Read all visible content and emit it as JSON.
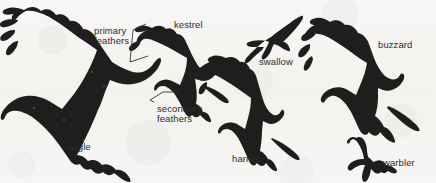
{
  "figure": {
    "background_color": "#f6f5f3",
    "silhouette_color": "#1f1d1b",
    "label_color": "#2b2b2b",
    "leader_line_color": "#3a3a3a",
    "width": 436,
    "height": 183
  },
  "labels": {
    "primary_feathers": "primary\nfeathers",
    "secondary_feathers": "secondary\nfeathers",
    "kestrel": "kestrel",
    "swallow": "swallow",
    "buzzard": "buzzard",
    "eagle": "eagle",
    "harrier": "harrier",
    "warbler": "warbler"
  },
  "birds": [
    {
      "name": "eagle",
      "label": "eagle",
      "x": 8,
      "y": 6,
      "w": 146,
      "h": 160
    },
    {
      "name": "kestrel",
      "label": "kestrel",
      "x": 128,
      "y": 20,
      "w": 86,
      "h": 100
    },
    {
      "name": "swallow",
      "label": "swallow",
      "x": 246,
      "y": 14,
      "w": 62,
      "h": 50
    },
    {
      "name": "harrier",
      "label": "harrier",
      "x": 198,
      "y": 55,
      "w": 105,
      "h": 120
    },
    {
      "name": "buzzard",
      "label": "buzzard",
      "x": 310,
      "y": 16,
      "w": 126,
      "h": 122
    },
    {
      "name": "warbler",
      "label": "warbler",
      "x": 348,
      "y": 132,
      "w": 56,
      "h": 50
    }
  ],
  "annotations": [
    {
      "name": "primary-feathers",
      "target_bird": "kestrel"
    },
    {
      "name": "secondary-feathers",
      "target_bird": "kestrel"
    }
  ]
}
